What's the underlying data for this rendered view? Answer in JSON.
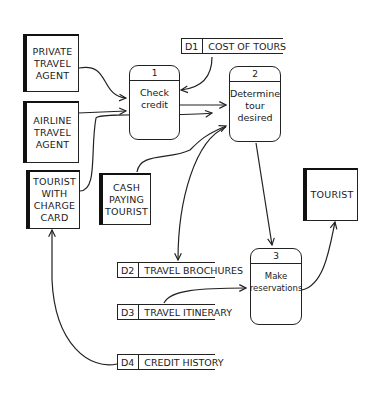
{
  "entities": [
    {
      "id": "private-travel-agent",
      "label": "PRIVATE\nTRAVEL\nAGENT"
    },
    {
      "id": "airline-travel-agent",
      "label": "AIRLINE\nTRAVEL\nAGENT"
    },
    {
      "id": "tourist-with-charge-card",
      "label": "TOURIST\nWITH\nCHARGE\nCARD"
    },
    {
      "id": "cash-paying-tourist",
      "label": "CASH\nPAYING\nTOURIST"
    },
    {
      "id": "tourist",
      "label": "TOURIST"
    }
  ],
  "processes": [
    {
      "num": "1",
      "label": "Check\ncredit"
    },
    {
      "num": "2",
      "label": "Determine\ntour\ndesired"
    },
    {
      "num": "3",
      "label": "Make\nreservations"
    }
  ],
  "data_stores": [
    {
      "id": "D1",
      "name": "COST OF TOURS"
    },
    {
      "id": "D2",
      "name": "TRAVEL BROCHURES"
    },
    {
      "id": "D3",
      "name": "TRAVEL ITINERARY"
    },
    {
      "id": "D4",
      "name": "CREDIT HISTORY"
    }
  ],
  "flows": [
    {
      "from": "PRIVATE TRAVEL AGENT",
      "to": "1"
    },
    {
      "from": "AIRLINE TRAVEL AGENT",
      "to": "1"
    },
    {
      "from": "TOURIST WITH CHARGE CARD",
      "to": "2"
    },
    {
      "from": "D1",
      "to": "1"
    },
    {
      "from": "1",
      "to": "2"
    },
    {
      "from": "CASH PAYING TOURIST",
      "to": "2"
    },
    {
      "from": "2",
      "to": "3"
    },
    {
      "from": "2",
      "to": "D2"
    },
    {
      "from": "D3",
      "to": "3"
    },
    {
      "from": "3",
      "to": "TOURIST"
    },
    {
      "from": "D4",
      "to": "TOURIST WITH CHARGE CARD"
    }
  ]
}
